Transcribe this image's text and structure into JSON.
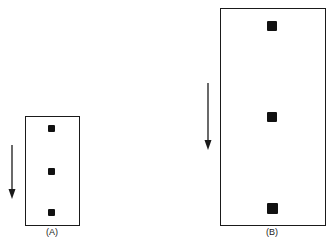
{
  "diagram": {
    "panels": [
      {
        "id": "A",
        "label": "(A)",
        "box": {
          "x": 25,
          "y": 116,
          "w": 55,
          "h": 110
        },
        "dots": [
          {
            "x": 51,
            "y": 128,
            "size": 7
          },
          {
            "x": 51,
            "y": 171,
            "size": 7
          },
          {
            "x": 51,
            "y": 212,
            "size": 7
          }
        ],
        "arrow": {
          "x": 12,
          "y1": 145,
          "y2": 198,
          "direction": "down"
        }
      },
      {
        "id": "B",
        "label": "(B)",
        "box": {
          "x": 220,
          "y": 8,
          "w": 106,
          "h": 218
        },
        "dots": [
          {
            "x": 272,
            "y": 26,
            "size": 10
          },
          {
            "x": 272,
            "y": 117,
            "size": 10
          },
          {
            "x": 272,
            "y": 208,
            "size": 10
          }
        ],
        "arrow": {
          "x": 208,
          "y1": 83,
          "y2": 150,
          "direction": "down"
        }
      }
    ]
  }
}
